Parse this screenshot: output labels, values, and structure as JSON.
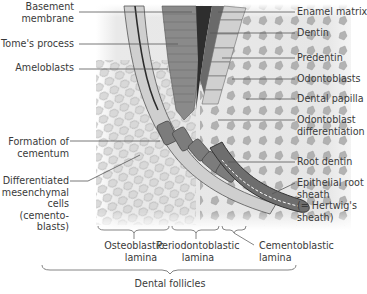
{
  "figure": {
    "left_labels": [
      {
        "id": "basement-membrane",
        "lines": [
          "Basement",
          "membrane"
        ]
      },
      {
        "id": "tomes-process",
        "lines": [
          "Tome's process"
        ]
      },
      {
        "id": "ameloblasts",
        "lines": [
          "Ameloblasts"
        ]
      },
      {
        "id": "formation-of-cementum",
        "lines": [
          "Formation of",
          "cementum"
        ]
      },
      {
        "id": "differentiated-mesenchymal-cells",
        "lines": [
          "Differentiated",
          "mesenchymal",
          "cells",
          "(cemento-",
          "blasts)"
        ]
      }
    ],
    "right_labels": [
      {
        "id": "enamel-matrix",
        "lines": [
          "Enamel matrix"
        ]
      },
      {
        "id": "dentin",
        "lines": [
          "Dentin"
        ]
      },
      {
        "id": "predentin",
        "lines": [
          "Predentin"
        ]
      },
      {
        "id": "odontoblasts",
        "lines": [
          "Odontoblasts"
        ]
      },
      {
        "id": "dental-papilla",
        "lines": [
          "Dental papilla"
        ]
      },
      {
        "id": "odontoblast-differentiation",
        "lines": [
          "Odontoblast",
          "differentiation"
        ]
      },
      {
        "id": "root-dentin",
        "lines": [
          "Root dentin"
        ]
      },
      {
        "id": "epithelial-root-sheath",
        "lines": [
          "Epithelial root",
          "sheath",
          "(= Hertwig's",
          "sheath)"
        ]
      }
    ],
    "bottom_labels": [
      {
        "id": "osteoblastic-lamina",
        "lines": [
          "Osteoblastic",
          "lamina"
        ]
      },
      {
        "id": "periodontoblastic-lamina",
        "lines": [
          "Periodontoblastic",
          "lamina"
        ]
      },
      {
        "id": "cementoblastic-lamina",
        "lines": [
          "Cementoblastic",
          "lamina"
        ]
      }
    ],
    "group_label": "Dental follicles",
    "colors": {
      "background_tissue": "#e4e4e4",
      "cells": "#a9a9a9",
      "enamel_organ": "#7d7d7d",
      "dentin_dark": "#3c3c3c",
      "label_text": "#3a3a3a",
      "leader_line": "#555555"
    }
  }
}
